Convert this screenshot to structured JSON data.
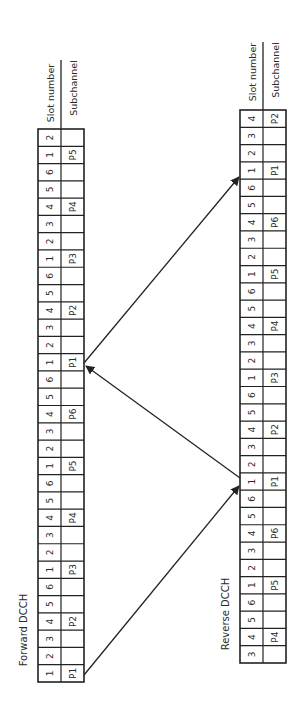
{
  "diagram": {
    "forward": {
      "title": "Forward DCCH",
      "row_labels": {
        "slot": "Slot number",
        "subchannel": "Subchannel"
      },
      "slots": [
        1,
        2,
        3,
        4,
        5,
        6,
        1,
        2,
        3,
        4,
        5,
        6,
        1,
        2,
        3,
        4,
        5,
        6,
        1,
        2,
        3,
        4,
        5,
        6,
        1,
        2,
        3,
        4,
        5,
        6,
        1,
        2
      ],
      "subchannels": [
        "P1",
        "",
        "",
        "P2",
        "",
        "",
        "P3",
        "",
        "",
        "P4",
        "",
        "",
        "P5",
        "",
        "",
        "P6",
        "",
        "",
        "P1",
        "",
        "",
        "P2",
        "",
        "",
        "P3",
        "",
        "",
        "P4",
        "",
        "",
        "P5",
        ""
      ]
    },
    "reverse": {
      "title": "Reverse DCCH",
      "row_labels": {
        "slot": "Slot number",
        "subchannel": "Subchannel"
      },
      "slots": [
        3,
        4,
        5,
        6,
        1,
        2,
        3,
        4,
        5,
        6,
        1,
        2,
        3,
        4,
        5,
        6,
        1,
        2,
        3,
        4,
        5,
        6,
        1,
        2,
        3,
        4,
        5,
        6,
        1,
        2,
        3,
        4
      ],
      "subchannels": [
        "",
        "P4",
        "",
        "",
        "P5",
        "",
        "",
        "P6",
        "",
        "",
        "P1",
        "",
        "",
        "P2",
        "",
        "",
        "P3",
        "",
        "",
        "P4",
        "",
        "",
        "P5",
        "",
        "",
        "P6",
        "",
        "",
        "P1",
        "",
        "",
        "P2"
      ]
    },
    "arrows": [
      {
        "from": "forward slot 1 (P1)",
        "to": "reverse slot 1 (P5)",
        "direction": "forward-to-reverse"
      },
      {
        "from": "reverse slot 1 (P1)",
        "to": "forward slot 1 (P1)",
        "direction": "reverse-to-forward"
      },
      {
        "from": "forward slot 1 (P1)",
        "to": "reverse slot 1 (P1)",
        "direction": "forward-to-reverse"
      }
    ]
  }
}
